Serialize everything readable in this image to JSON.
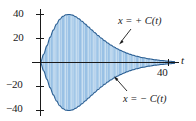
{
  "figure": {
    "background": "#ffffff",
    "axis_color": "#1a1a1a",
    "curve_color": "#2f6ea5",
    "fill_color": "#5b9bd5",
    "fill_color_light": "#a8cbe8"
  },
  "axes": {
    "x_name": "t",
    "y_ticks": [
      "40",
      "20",
      "−20",
      "−40"
    ],
    "y_tick_values": [
      40,
      20,
      -20,
      -40
    ],
    "x_ticks": [
      "40"
    ],
    "x_tick_values": [
      40
    ]
  },
  "annotations": {
    "upper": "x = + C(t)",
    "lower": "x = − C(t)"
  },
  "chart_data": {
    "type": "line",
    "title": "",
    "xlabel": "t",
    "ylabel": "x",
    "xlim": [
      0,
      44
    ],
    "ylim": [
      -48,
      48
    ],
    "grid": false,
    "legend": null,
    "envelope": {
      "name": "C(t)",
      "t": [
        0,
        1,
        2,
        3,
        4,
        5,
        6,
        7,
        8,
        9,
        10,
        11,
        12,
        13,
        14,
        15,
        16,
        17,
        18,
        19,
        20,
        21,
        22,
        23,
        24,
        25,
        26,
        27,
        28,
        29,
        30,
        32,
        34,
        36,
        38,
        40,
        42
      ],
      "values": [
        0,
        7,
        14,
        21,
        27,
        32,
        36,
        38.5,
        39.8,
        40,
        39.5,
        38.2,
        36.4,
        34.3,
        32.0,
        29.6,
        27.2,
        24.8,
        22.5,
        20.3,
        18.2,
        16.3,
        14.5,
        12.9,
        11.4,
        10.1,
        8.9,
        7.8,
        6.8,
        6.0,
        5.2,
        4.0,
        3.0,
        2.2,
        1.6,
        1.1,
        0.7
      ]
    },
    "series": [
      {
        "name": "x = + C(t)",
        "kind": "upper-envelope"
      },
      {
        "name": "x = − C(t)",
        "kind": "lower-envelope"
      },
      {
        "name": "x(t)",
        "kind": "oscillation",
        "note": "dense sinusoid filling the envelope"
      }
    ]
  }
}
